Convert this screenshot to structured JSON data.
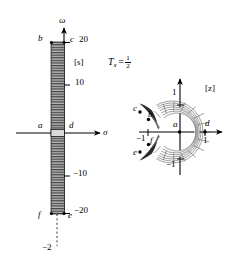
{
  "figure": {
    "title_formula": {
      "symbol": "T",
      "subscript": "x",
      "equals": "=",
      "numerator": "1",
      "denominator": "2"
    },
    "left_plane": {
      "name": "s-plane",
      "plane_label": "[s]",
      "vertical_axis_label": "ω",
      "horizontal_axis_label": "σ",
      "ticks": [
        {
          "value": "20",
          "y_units": 20
        },
        {
          "value": "10",
          "y_units": 10
        },
        {
          "value": "−10",
          "y_units": -10
        },
        {
          "value": "−20",
          "y_units": -20
        }
      ],
      "sigma_tick": "−2",
      "corner_points": [
        {
          "label": "b",
          "desc": "top-left of strip"
        },
        {
          "label": "c",
          "desc": "top-right of strip"
        },
        {
          "label": "a",
          "desc": "origin-left of strip"
        },
        {
          "label": "d",
          "desc": "origin-right of strip"
        },
        {
          "label": "f",
          "desc": "bottom-left of strip"
        },
        {
          "label": "e",
          "desc": "bottom-right of strip"
        }
      ],
      "strip_description": "narrow vertical hatched strip from −20 to +20 along ω axis"
    },
    "right_plane": {
      "name": "z-plane",
      "plane_label": "[z]",
      "axis_ticks": [
        {
          "label": "1",
          "position": "right"
        },
        {
          "label": "−1",
          "position": "left"
        },
        {
          "label": "1",
          "position": "top"
        },
        {
          "label": "−1",
          "position": "bottom"
        }
      ],
      "corner_points": [
        {
          "label": "a",
          "desc": "inner point near origin"
        },
        {
          "label": "b",
          "desc": "upper left inner"
        },
        {
          "label": "c",
          "desc": "upper left outer"
        },
        {
          "label": "d",
          "desc": "right on unit circle"
        },
        {
          "label": "e",
          "desc": "lower left outer"
        },
        {
          "label": "f",
          "desc": "lower left inner"
        }
      ],
      "region_description": "C-shaped annular grid region open to the left, unit radius"
    }
  },
  "colors": {
    "ink": "#000000",
    "grid": "#555555",
    "fill": "#888888",
    "background": "#ffffff"
  }
}
